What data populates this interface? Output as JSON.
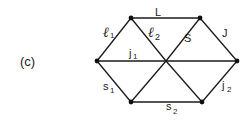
{
  "figure": {
    "panel_label": "(c)",
    "nodes": [
      {
        "id": "top-left",
        "x": 131,
        "y": 18
      },
      {
        "id": "top-right",
        "x": 200,
        "y": 18
      },
      {
        "id": "left",
        "x": 97,
        "y": 61
      },
      {
        "id": "center",
        "x": 166,
        "y": 61
      },
      {
        "id": "right",
        "x": 237,
        "y": 61
      },
      {
        "id": "bottom-left",
        "x": 131,
        "y": 102
      },
      {
        "id": "bottom-right",
        "x": 202,
        "y": 102
      }
    ],
    "edges": [
      {
        "from": "top-left",
        "to": "top-right",
        "label": "L"
      },
      {
        "from": "left",
        "to": "top-left",
        "label": "ℓ1"
      },
      {
        "from": "top-left",
        "to": "center",
        "label": "ℓ2"
      },
      {
        "from": "center",
        "to": "top-right",
        "label": "S"
      },
      {
        "from": "top-right",
        "to": "right",
        "label": "J"
      },
      {
        "from": "left",
        "to": "center",
        "label": "j1"
      },
      {
        "from": "center",
        "to": "right",
        "label": ""
      },
      {
        "from": "left",
        "to": "bottom-left",
        "label": "s1"
      },
      {
        "from": "bottom-left",
        "to": "center",
        "label": ""
      },
      {
        "from": "center",
        "to": "bottom-right",
        "label": ""
      },
      {
        "from": "bottom-left",
        "to": "bottom-right",
        "label": "s2"
      },
      {
        "from": "bottom-right",
        "to": "right",
        "label": "j2"
      }
    ],
    "labels": {
      "L": "L",
      "l1_main": "ℓ",
      "l1_sub": "1",
      "l2_main": "ℓ",
      "l2_sub": "2",
      "S": "S",
      "J": "J",
      "j1_main": "j",
      "j1_sub": "1",
      "s1_main": "s",
      "s1_sub": "1",
      "s2_main": "s",
      "s2_sub": "2",
      "j2_main": "j",
      "j2_sub": "2"
    }
  }
}
